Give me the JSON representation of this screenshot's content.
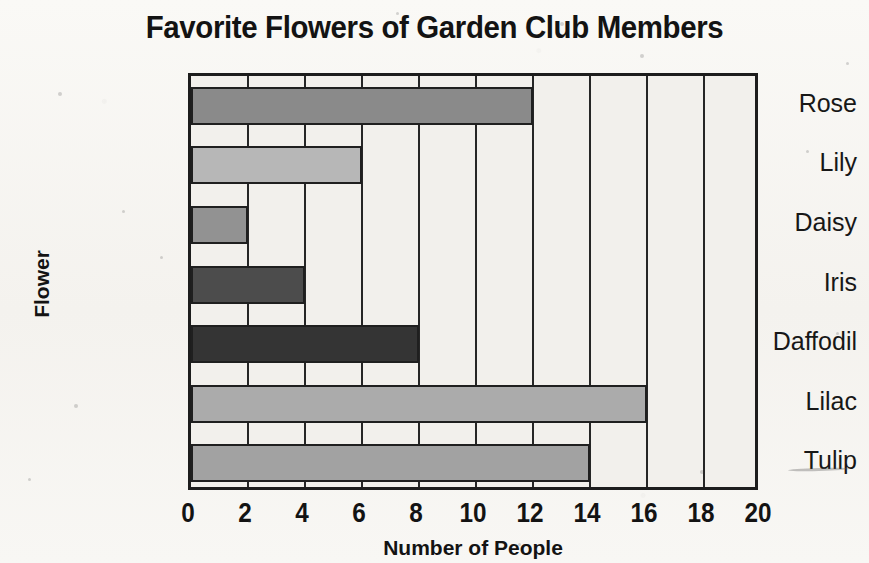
{
  "chart_data": {
    "type": "bar",
    "orientation": "horizontal",
    "title": "Favorite Flowers of Garden Club Members",
    "xlabel": "Number of People",
    "ylabel": "Flower",
    "categories": [
      "Rose",
      "Lily",
      "Daisy",
      "Iris",
      "Daffodil",
      "Lilac",
      "Tulip"
    ],
    "values": [
      12,
      6,
      2,
      4,
      8,
      16,
      14
    ],
    "bar_colors": [
      "#8a8a8a",
      "#b7b7b7",
      "#929292",
      "#4c4c4c",
      "#343434",
      "#ababab",
      "#a2a2a2"
    ],
    "xlim": [
      0,
      20
    ],
    "xticks": [
      0,
      2,
      4,
      6,
      8,
      10,
      12,
      14,
      16,
      18,
      20
    ],
    "xtick_labels": [
      "0",
      "2",
      "4",
      "6",
      "8",
      "10",
      "12",
      "14",
      "16",
      "18",
      "20"
    ],
    "grid": "vertical",
    "gridline_step": 2,
    "legend": null,
    "plot_background": "#f2f0ec",
    "axis_color": "#1d1d1d",
    "bars": [
      {
        "category": "Rose",
        "value": 12,
        "color": "#8a8a8a"
      },
      {
        "category": "Lily",
        "value": 6,
        "color": "#b7b7b7"
      },
      {
        "category": "Daisy",
        "value": 2,
        "color": "#929292"
      },
      {
        "category": "Iris",
        "value": 4,
        "color": "#4c4c4c"
      },
      {
        "category": "Daffodil",
        "value": 8,
        "color": "#343434"
      },
      {
        "category": "Lilac",
        "value": 16,
        "color": "#ababab"
      },
      {
        "category": "Tulip",
        "value": 14,
        "color": "#a2a2a2"
      }
    ]
  },
  "page": {
    "background": "#f7f6f3",
    "width": 869,
    "height": 563
  }
}
